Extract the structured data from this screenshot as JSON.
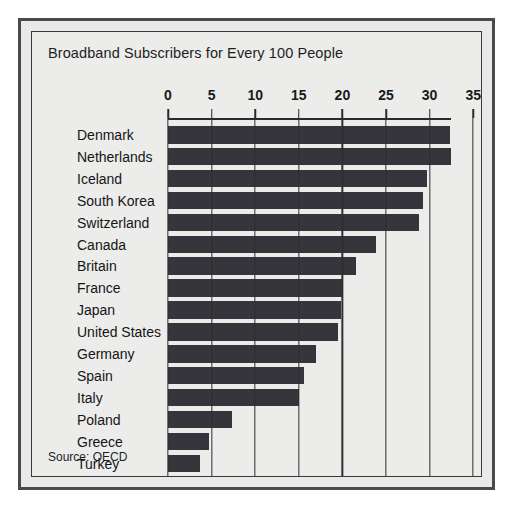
{
  "chart_data": {
    "type": "bar",
    "orientation": "horizontal",
    "title": "Broadband Subscribers for Every 100 People",
    "xlabel": "",
    "ylabel": "",
    "xlim": [
      0,
      35
    ],
    "xticks": [
      0,
      5,
      10,
      15,
      20,
      25,
      30,
      35
    ],
    "xtick_labels": [
      "0",
      "5",
      "10",
      "15",
      "20",
      "25",
      "30",
      "35"
    ],
    "grid": true,
    "legend": "none",
    "source": "Source: OECD",
    "categories": [
      "Denmark",
      "Netherlands",
      "Iceland",
      "South Korea",
      "Switzerland",
      "Canada",
      "Britain",
      "France",
      "Japan",
      "United States",
      "Germany",
      "Spain",
      "Italy",
      "Poland",
      "Greece",
      "Turkey"
    ],
    "values": [
      32.3,
      32.5,
      29.7,
      29.3,
      28.8,
      23.9,
      21.6,
      20.1,
      19.8,
      19.5,
      17.0,
      15.6,
      15.0,
      7.3,
      4.7,
      3.7
    ],
    "colors": {
      "bar": "#35353b",
      "panel_background": "#ececeb",
      "frame": "#4a4a4a",
      "gridline": "#2f2f2f",
      "text": "#1e1e1e"
    }
  }
}
